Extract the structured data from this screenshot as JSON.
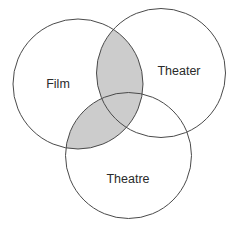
{
  "diagram": {
    "type": "venn",
    "shade_color": "#cccccc",
    "stroke_color": "#4a4a4a",
    "shaded_regions": [
      "Film ∩ Theater",
      "Film ∩ Theatre"
    ],
    "sets": [
      {
        "id": "film",
        "label": "Film",
        "cx": 78,
        "cy": 84,
        "r": 65,
        "label_x": 58,
        "label_y": 88
      },
      {
        "id": "theater",
        "label": "Theater",
        "cx": 161,
        "cy": 73,
        "r": 64.5,
        "label_x": 179,
        "label_y": 75
      },
      {
        "id": "theatre",
        "label": "Theatre",
        "cx": 128.5,
        "cy": 155.5,
        "r": 63,
        "label_x": 128,
        "label_y": 183
      }
    ]
  }
}
